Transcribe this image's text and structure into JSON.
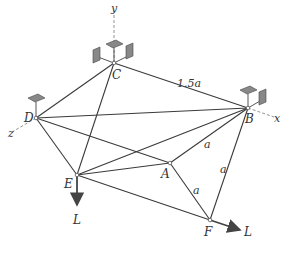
{
  "figure": {
    "axes": {
      "x": "x",
      "y": "y",
      "z": "z"
    },
    "joints": {
      "A": "A",
      "B": "B",
      "C": "C",
      "D": "D",
      "E": "E",
      "F": "F"
    },
    "dimensions": {
      "CB": "1.5a",
      "AB": "a",
      "AF": "a",
      "BF": "a"
    },
    "loads": {
      "E": "L",
      "F": "L"
    }
  }
}
